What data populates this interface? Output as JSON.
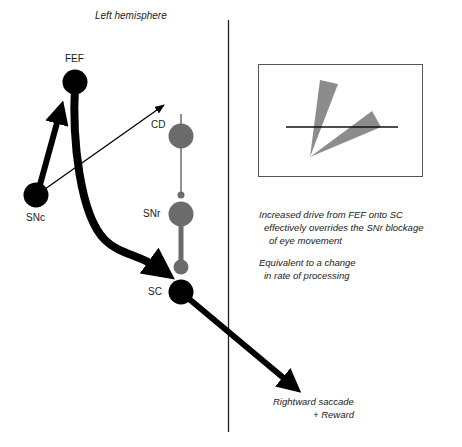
{
  "title": "Left hemisphere",
  "nodes": {
    "fef": {
      "label": "FEF",
      "color": "#000000"
    },
    "snc": {
      "label": "SNc",
      "color": "#000000"
    },
    "cd": {
      "label": "CD",
      "color": "#6b6b6b"
    },
    "snr": {
      "label": "SNr",
      "color": "#6b6b6b"
    },
    "sc": {
      "label": "SC",
      "color": "#000000"
    }
  },
  "inset": {
    "description": "Two grey wedge distributions from a common origin crossing a horizontal threshold line"
  },
  "annotations": {
    "note1": {
      "line1": "Increased drive from FEF onto SC",
      "line2": "effectively overrides the SNr blockage",
      "line3": "of eye movement"
    },
    "note2": {
      "line1": "Equivalent to a change",
      "line2": "in rate of processing"
    },
    "outcome": {
      "line1": "Rightward saccade",
      "line2": "+ Reward"
    }
  },
  "colors": {
    "black": "#000000",
    "grey": "#6b6b6b",
    "wedge": "#8c8c8c"
  }
}
